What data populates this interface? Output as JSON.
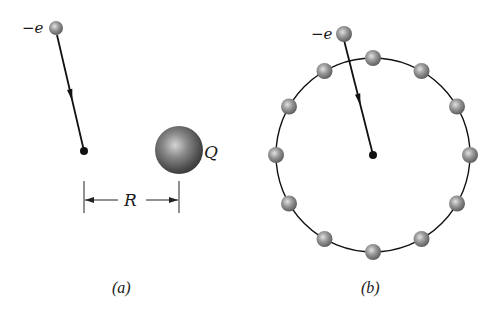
{
  "colors": {
    "background": "#ffffff",
    "ink": "#111111",
    "sphere_light": "#d8d8d8",
    "sphere_mid": "#8c8c8c",
    "sphere_dark": "#4a4a4a"
  },
  "panel_a": {
    "caption": "(a)",
    "electron_label": "−e",
    "charge_label": "Q",
    "distance_label": "R",
    "electron": {
      "cx": 56,
      "cy": 28,
      "r": 7
    },
    "trajectory": {
      "x1": 57,
      "y1": 35,
      "x2": 84,
      "y2": 151
    },
    "endpoint_dot": {
      "cx": 84,
      "cy": 151,
      "r": 4
    },
    "charge_sphere": {
      "cx": 179,
      "cy": 150,
      "r": 24
    },
    "dimension": {
      "x_left": 84,
      "x_right": 179,
      "y": 200,
      "tick_top": 181,
      "tick_bottom": 213
    }
  },
  "panel_b": {
    "caption": "(b)",
    "electron_label": "−e",
    "ring": {
      "cx": 373,
      "cy": 155,
      "r": 97,
      "sphere_count": 12,
      "sphere_r": 8
    },
    "electron": {
      "cx": 344,
      "cy": 34,
      "r": 8
    },
    "trajectory": {
      "x1": 344,
      "y1": 40,
      "x2": 373,
      "y2": 155
    },
    "center_dot": {
      "cx": 373,
      "cy": 155,
      "r": 4
    }
  }
}
